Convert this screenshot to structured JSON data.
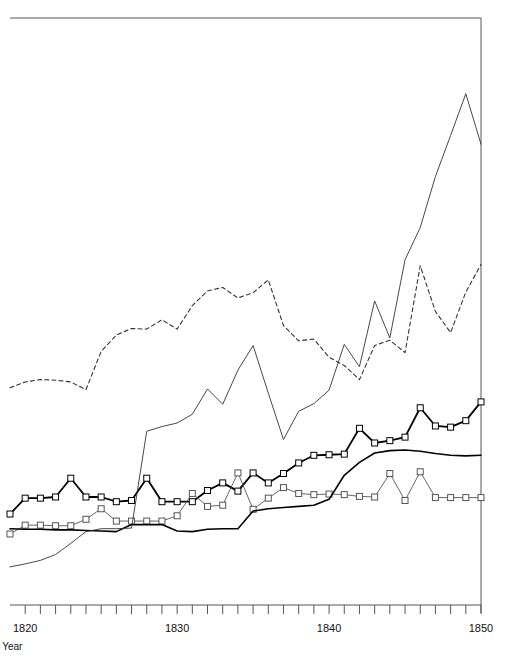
{
  "chart_data": {
    "type": "line",
    "title": "",
    "xlabel": "Year",
    "ylabel": "",
    "grid": false,
    "legend": "none",
    "xlim": [
      1819,
      1850
    ],
    "ylim": [
      0,
      100
    ],
    "xticks": [
      1820,
      1830,
      1840,
      1850
    ],
    "xtick_labels": [
      "1820",
      "1830",
      "1840",
      "1850"
    ],
    "xtick_minor_step": 1,
    "axis": {
      "left_visible": false,
      "right_visible": true,
      "top_visible": true,
      "bottom_visible": true,
      "ytick_labels": []
    },
    "colors": {
      "series_1": "#000000",
      "series_2": "#555555",
      "series_3": "#333333",
      "series_4": "#333333",
      "series_5": "#000000",
      "axis": "#555555",
      "background": "#ffffff"
    },
    "x": [
      1819,
      1820,
      1821,
      1822,
      1823,
      1824,
      1825,
      1826,
      1827,
      1828,
      1829,
      1830,
      1831,
      1832,
      1833,
      1834,
      1835,
      1836,
      1837,
      1838,
      1839,
      1840,
      1841,
      1842,
      1843,
      1844,
      1845,
      1846,
      1847,
      1848,
      1849,
      1850
    ],
    "series": [
      {
        "name": "series-marked-bold",
        "style": "solid",
        "width": 1.8,
        "color": "#000000",
        "marker": "square",
        "marker_size": 6,
        "values": [
          15.5,
          18.2,
          18.2,
          18.4,
          21.6,
          18.4,
          18.4,
          17.6,
          17.8,
          21.6,
          17.6,
          17.6,
          17.6,
          19.5,
          20.8,
          19.4,
          22.5,
          20.8,
          22.4,
          24.2,
          25.5,
          25.6,
          25.7,
          30.1,
          27.6,
          28.0,
          28.6,
          33.6,
          30.5,
          30.3,
          31.4,
          34.6
        ]
      },
      {
        "name": "series-marked-thin",
        "style": "solid",
        "width": 0.9,
        "color": "#555555",
        "marker": "square",
        "marker_size": 6,
        "values": [
          12.1,
          13.6,
          13.6,
          13.5,
          13.5,
          14.6,
          16.4,
          14.3,
          14.3,
          14.3,
          14.3,
          15.2,
          19.0,
          16.8,
          17.0,
          22.5,
          16.3,
          18.2,
          20.0,
          19.0,
          18.8,
          18.9,
          18.8,
          18.5,
          18.4,
          22.4,
          17.8,
          22.7,
          18.3,
          18.3,
          18.3,
          18.3
        ]
      },
      {
        "name": "series-plain-bold",
        "style": "solid",
        "width": 1.6,
        "color": "#000000",
        "marker": "none",
        "marker_size": 0,
        "values": [
          13.0,
          12.9,
          12.9,
          12.8,
          12.8,
          12.7,
          12.6,
          12.5,
          13.7,
          13.7,
          13.7,
          12.6,
          12.5,
          12.9,
          13.0,
          13.0,
          16.0,
          16.4,
          16.6,
          16.8,
          17.0,
          18.0,
          22.1,
          24.3,
          25.9,
          26.3,
          26.4,
          26.2,
          25.8,
          25.5,
          25.4,
          25.5
        ]
      },
      {
        "name": "series-plain-thin",
        "style": "solid",
        "width": 0.9,
        "color": "#333333",
        "marker": "none",
        "marker_size": 0,
        "values": [
          6.5,
          7.0,
          7.6,
          8.6,
          10.5,
          12.5,
          13.0,
          13.0,
          13.1,
          29.6,
          30.4,
          31.0,
          32.5,
          36.8,
          34.2,
          40.0,
          44.2,
          36.1,
          28.2,
          33.0,
          34.3,
          36.6,
          44.4,
          40.6,
          51.8,
          45.5,
          58.8,
          64.3,
          73.0,
          80.0,
          87.1,
          78.5
        ]
      },
      {
        "name": "series-dashed",
        "style": "dashed",
        "width": 1.1,
        "color": "#333333",
        "marker": "none",
        "marker_size": 0,
        "values": [
          37.0,
          38.0,
          38.4,
          38.3,
          38.0,
          36.7,
          43.2,
          46.0,
          47.1,
          47.0,
          48.6,
          47.0,
          51.0,
          53.5,
          54.1,
          52.3,
          53.2,
          55.4,
          47.6,
          45.0,
          45.3,
          42.2,
          40.8,
          38.4,
          44.2,
          45.1,
          43.0,
          57.8,
          50.0,
          46.4,
          53.3,
          58.0
        ]
      }
    ]
  }
}
